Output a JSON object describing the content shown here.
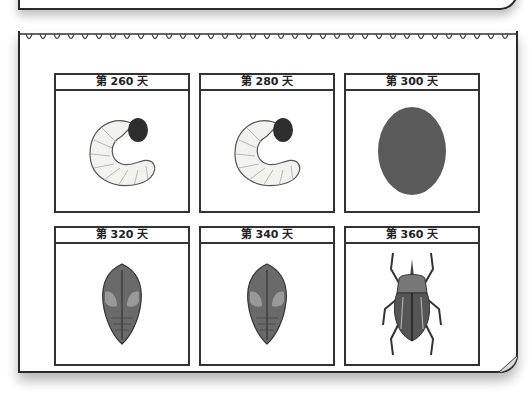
{
  "stages": [
    {
      "label": "第 260 天",
      "image": "larva-grub-icon"
    },
    {
      "label": "第 280 天",
      "image": "larva-grub-icon"
    },
    {
      "label": "第 300 天",
      "image": "cocoon-egg-icon"
    },
    {
      "label": "第 320 天",
      "image": "pupa-icon"
    },
    {
      "label": "第 340 天",
      "image": "pupa-icon"
    },
    {
      "label": "第 360 天",
      "image": "adult-beetle-icon"
    }
  ]
}
